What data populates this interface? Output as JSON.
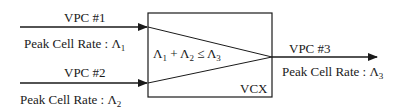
{
  "diagram": {
    "inputs": [
      {
        "name": "VPC #1",
        "rate_label": "Peak Cell Rate : ",
        "rate_symbol": "Λ",
        "rate_sub": "1"
      },
      {
        "name": "VPC #2",
        "rate_label": "Peak Cell Rate : ",
        "rate_symbol": "Λ",
        "rate_sub": "2"
      }
    ],
    "output": {
      "name": "VPC #3",
      "rate_label": "Peak Cell Rate : ",
      "rate_symbol": "Λ",
      "rate_sub": "3"
    },
    "node": {
      "label": "VCX",
      "condition": {
        "a": "Λ",
        "a_sub": "1",
        "plus": " + ",
        "b": "Λ",
        "b_sub": "2",
        "le": " ≤ ",
        "c": "Λ",
        "c_sub": "3"
      }
    },
    "colors": {
      "stroke": "#1a1a1a",
      "background": "#ffffff"
    }
  }
}
